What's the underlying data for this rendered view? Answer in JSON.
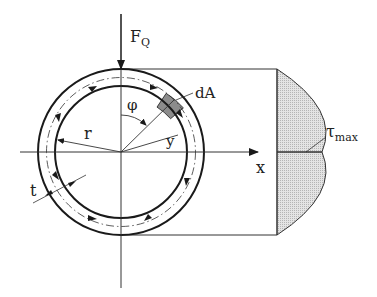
{
  "diagram": {
    "labels": {
      "force": "F",
      "force_sub": "Q",
      "angle": "φ",
      "area_element": "dA",
      "radius": "r",
      "y_coord": "y",
      "thickness": "t",
      "x_axis": "x",
      "tau": "τ",
      "tau_sub": "max"
    },
    "colors": {
      "line": "#1a1a1a",
      "area_element_fill": "#8c8c8c",
      "distribution_fill": "#d9d9d9",
      "background": "#ffffff"
    }
  }
}
